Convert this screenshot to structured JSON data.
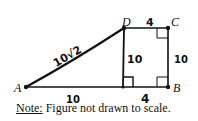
{
  "diagram": {
    "type": "geometry-figure",
    "points": {
      "A": {
        "label": "A",
        "x": 26,
        "y": 87
      },
      "B": {
        "label": "B",
        "x": 168,
        "y": 87
      },
      "C": {
        "label": "C",
        "x": 168,
        "y": 28
      },
      "D": {
        "label": "D",
        "x": 124,
        "y": 28
      },
      "E": {
        "x": 123,
        "y": 87
      }
    },
    "segment_labels": {
      "AD": "10√2",
      "DE": "10",
      "DC": "4",
      "CB": "10",
      "AE": "10",
      "EB": "4"
    },
    "right_angles": [
      "C",
      "B",
      "E"
    ],
    "note_prefix": "Note:",
    "note_text": " Figure not drawn to scale."
  }
}
